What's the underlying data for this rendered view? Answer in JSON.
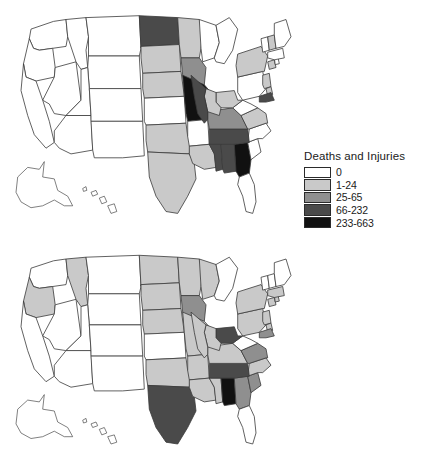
{
  "figure": {
    "panels": [
      {
        "id": "deaths-injuries",
        "legend": {
          "title": "Deaths and Injuries",
          "entries": [
            {
              "label": "0",
              "color": "#ffffff"
            },
            {
              "label": "1-24",
              "color": "#c9c9c9"
            },
            {
              "label": "25-65",
              "color": "#8f8f8f"
            },
            {
              "label": "66-232",
              "color": "#4a4a4a"
            },
            {
              "label": "233-663",
              "color": "#111111"
            }
          ]
        }
      },
      {
        "id": "damage",
        "legend": {
          "title": "Damage (millions $)",
          "entries": [
            {
              "label": "0",
              "color": "#ffffff"
            },
            {
              "label": "0.01-2.18",
              "color": "#c9c9c9"
            },
            {
              "label": "2.19-12.68",
              "color": "#8f8f8f"
            },
            {
              "label": "12.69-184.26",
              "color": "#4a4a4a"
            },
            {
              "label": "184.27-447.06",
              "color": "#111111"
            }
          ]
        }
      }
    ]
  },
  "chart_data": {
    "type": "heatmap",
    "title": "",
    "subtitle": "",
    "layout": "two stacked choropleth maps of the United States, legend at right of each map",
    "maps": [
      {
        "title": "Deaths and Injuries",
        "variable": "Deaths and Injuries",
        "units": "count",
        "class_colors": [
          "#ffffff",
          "#c9c9c9",
          "#8f8f8f",
          "#4a4a4a",
          "#111111"
        ],
        "classes": [
          "0",
          "1-24",
          "25-65",
          "66-232",
          "233-663"
        ],
        "values": {
          "WA": 0,
          "OR": 0,
          "CA": 0,
          "NV": 0,
          "ID": 0,
          "MT": 0,
          "WY": 0,
          "UT": 0,
          "AZ": 0,
          "CO": 0,
          "NM": 0,
          "ND": 3,
          "SD": 1,
          "NE": 1,
          "KS": 0,
          "OK": 1,
          "TX": 1,
          "MN": 1,
          "IA": 2,
          "MO": 4,
          "AR": 0,
          "LA": 1,
          "MS": 3,
          "AL": 3,
          "GA": 4,
          "FL": 0,
          "SC": 0,
          "NC": 0,
          "TN": 3,
          "KY": 2,
          "VA": 1,
          "WV": 0,
          "OH": 1,
          "IN": 1,
          "IL": 3,
          "WI": 0,
          "MI": 0,
          "PA": 0,
          "NY": 1,
          "NJ": 1,
          "DE": 1,
          "MD": 3,
          "CT": 1,
          "RI": 0,
          "MA": 0,
          "VT": 0,
          "NH": 1,
          "ME": 0,
          "AK": 0,
          "HI": 0
        }
      },
      {
        "title": "Damage (millions $)",
        "variable": "Damage",
        "units": "millions of dollars",
        "class_colors": [
          "#ffffff",
          "#c9c9c9",
          "#8f8f8f",
          "#4a4a4a",
          "#111111"
        ],
        "classes": [
          "0",
          "0.01-2.18",
          "2.19-12.68",
          "12.69-184.26",
          "184.27-447.06"
        ],
        "values": {
          "WA": 0,
          "OR": 1,
          "CA": 0,
          "NV": 0,
          "ID": 1,
          "MT": 0,
          "WY": 0,
          "UT": 0,
          "AZ": 0,
          "CO": 0,
          "NM": 0,
          "ND": 1,
          "SD": 1,
          "NE": 1,
          "KS": 0,
          "OK": 1,
          "TX": 3,
          "MN": 1,
          "IA": 2,
          "MO": 1,
          "AR": 1,
          "LA": 1,
          "MS": 1,
          "AL": 4,
          "GA": 2,
          "FL": 0,
          "SC": 2,
          "NC": 1,
          "TN": 3,
          "KY": 1,
          "VA": 2,
          "WV": 0,
          "OH": 3,
          "IN": 1,
          "IL": 1,
          "WI": 1,
          "MI": 0,
          "PA": 1,
          "NY": 1,
          "NJ": 1,
          "DE": 1,
          "MD": 2,
          "CT": 1,
          "RI": 1,
          "MA": 1,
          "VT": 0,
          "NH": 0,
          "ME": 0,
          "AK": 0,
          "HI": 0
        }
      }
    ]
  }
}
